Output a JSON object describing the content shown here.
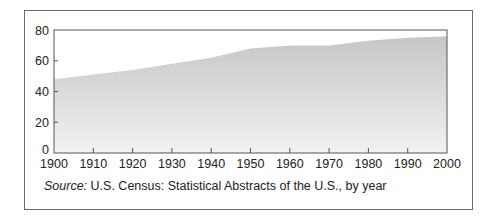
{
  "chart_data": {
    "type": "area",
    "title": "",
    "xlabel": "",
    "ylabel": "",
    "x": [
      1900,
      1910,
      1920,
      1930,
      1940,
      1950,
      1960,
      1970,
      1980,
      1990,
      2000
    ],
    "values": [
      48,
      51,
      54,
      58,
      62,
      68,
      70,
      70,
      73,
      75,
      76
    ],
    "series": [
      {
        "name": "",
        "x": [
          1900,
          1910,
          1920,
          1930,
          1940,
          1950,
          1960,
          1970,
          1980,
          1990,
          2000
        ],
        "values": [
          48,
          51,
          54,
          58,
          62,
          68,
          70,
          70,
          73,
          75,
          76
        ]
      }
    ],
    "ylim": [
      0,
      80
    ],
    "xlim": [
      1900,
      2000
    ],
    "yticks": [
      0,
      20,
      40,
      60,
      80
    ],
    "xticks": [
      1900,
      1910,
      1920,
      1930,
      1940,
      1950,
      1960,
      1970,
      1980,
      1990,
      2000
    ],
    "grid": false,
    "legend": null,
    "fill": {
      "top_color": "#c6c6c6",
      "bottom_color": "#f2f2f2"
    },
    "annotations": []
  },
  "source": {
    "label": "Source:",
    "text": " U.S. Census: Statistical Abstracts of the U.S., by year"
  }
}
